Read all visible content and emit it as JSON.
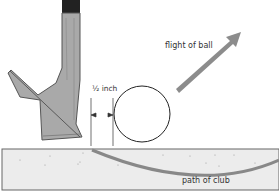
{
  "labels": {
    "flight_of_ball": "flight of ball",
    "gap": "½ inch",
    "path_of_club": "path of club"
  },
  "colors": {
    "club_fill": "#a9a9a9",
    "club_stroke": "#555555",
    "shaft": "#222222",
    "arrow": "#8c8c8c",
    "ground_fill": "#ececec",
    "ground_stroke": "#666666",
    "club_path": "#888888",
    "ball_stroke": "#222222"
  }
}
